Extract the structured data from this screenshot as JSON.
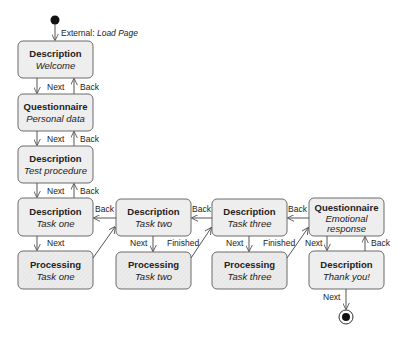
{
  "diagram": {
    "start_label": "External:",
    "start_label_italic": "Load Page",
    "states": [
      {
        "id": "desc-welcome",
        "title": "Description",
        "sub": "Welcome",
        "kind": "normal"
      },
      {
        "id": "quest-personal",
        "title": "Questionnaire",
        "sub": "Personal data",
        "kind": "normal"
      },
      {
        "id": "desc-test",
        "title": "Description",
        "sub": "Test procedure",
        "kind": "normal"
      },
      {
        "id": "desc-task1",
        "title": "Description",
        "sub": "Task one",
        "kind": "normal"
      },
      {
        "id": "proc-task1",
        "title": "Processing",
        "sub": "Task one",
        "kind": "processing"
      },
      {
        "id": "desc-task2",
        "title": "Description",
        "sub": "Task two",
        "kind": "normal"
      },
      {
        "id": "proc-task2",
        "title": "Processing",
        "sub": "Task two",
        "kind": "processing"
      },
      {
        "id": "desc-task3",
        "title": "Description",
        "sub": "Task three",
        "kind": "normal"
      },
      {
        "id": "proc-task3",
        "title": "Processing",
        "sub": "Task three",
        "kind": "processing"
      },
      {
        "id": "quest-emotional",
        "title": "Questionnaire",
        "sub": "Emotional",
        "sub2": "response",
        "kind": "normal"
      },
      {
        "id": "desc-thanks",
        "title": "Description",
        "sub": "Thank you!",
        "kind": "normal"
      }
    ],
    "labels": {
      "next": "Next",
      "back": "Back",
      "finished": "Finished"
    }
  }
}
